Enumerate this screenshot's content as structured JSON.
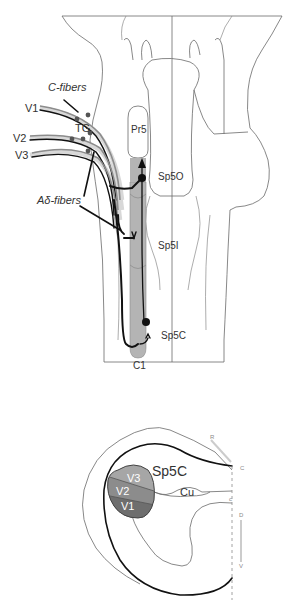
{
  "colors": {
    "nucleus_fill": "#b4b4b4",
    "v1": "#6e6e6e",
    "v2": "#8c8c8c",
    "v3": "#a6a6a6",
    "outline": "#6a6a6a",
    "fiber": "#111111"
  },
  "top_panel": {
    "fiber_labels": {
      "c_fibers": "C-fibers",
      "a_delta_fibers": "Aδ-fibers"
    },
    "nerve_branches": [
      "V1",
      "V2",
      "V3"
    ],
    "ganglion": "TG",
    "nuclei": {
      "pr5": "Pr5",
      "sp5o": "Sp5O",
      "sp5i": "Sp5I",
      "sp5c": "Sp5C",
      "c1": "C1"
    }
  },
  "bottom_panel": {
    "nucleus": "Sp5C",
    "cuneate": "Cu",
    "somatotopy": [
      "V3",
      "V2",
      "V1"
    ],
    "axis_labels": {
      "r": "R",
      "c": "C",
      "c_small": "c",
      "d": "D",
      "v": "V"
    }
  }
}
